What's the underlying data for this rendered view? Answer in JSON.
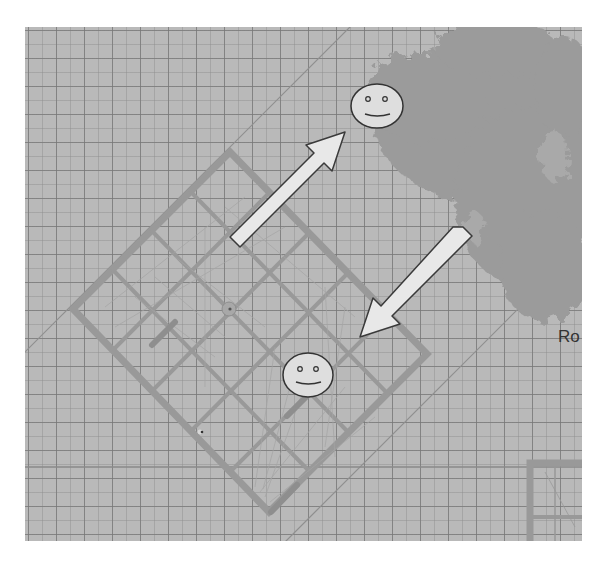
{
  "scene": {
    "type": "top-down simulation view",
    "background_color": "#b9b9b9",
    "grid": {
      "minor_cell_px": 14,
      "major_cell_px": 28,
      "line_color": "#787878"
    },
    "structure_color": "#9a9a9a",
    "canopy_color": "#999999",
    "arrow_fill": "#e6e6e6",
    "face_fill": "#dcdcdc",
    "outline_color": "#333333"
  },
  "objects": {
    "building": {
      "label": "rotated-building",
      "rotation_deg": 45
    },
    "tree": {
      "label": "tree-canopy"
    },
    "agents": [
      {
        "id": "agent-top",
        "label": "smiley"
      },
      {
        "id": "agent-bottom",
        "label": "smiley"
      }
    ],
    "arrows": [
      {
        "id": "arrow-out",
        "direction": "up-right"
      },
      {
        "id": "arrow-in",
        "direction": "down-left"
      }
    ],
    "corner_structure": {
      "label": "partial-building-bottom-right"
    }
  },
  "labels": {
    "edge_text": "Ro"
  }
}
